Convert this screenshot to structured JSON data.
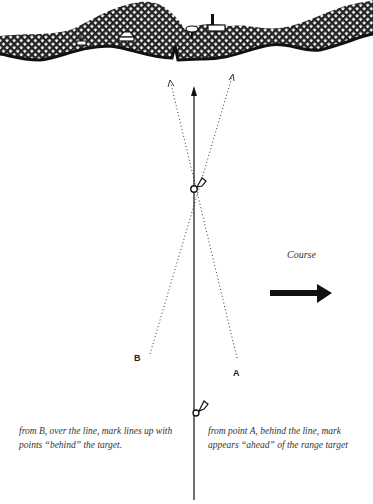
{
  "diagram": {
    "labels": {
      "point_a": "A",
      "point_b": "B",
      "course": "Course"
    },
    "captions": {
      "left": "from B, over the line, mark lines up with points “behind” the target.",
      "right": "from point A, behind the line, mark appears “ahead” of the range target"
    },
    "elements": [
      "shoreline-hatched",
      "range-line-arrow",
      "sight-line-from-A",
      "sight-line-from-B",
      "range-marker-upper",
      "range-marker-lower",
      "course-arrow"
    ],
    "colors": {
      "ink": "#111111",
      "background": "#ffffff"
    }
  }
}
